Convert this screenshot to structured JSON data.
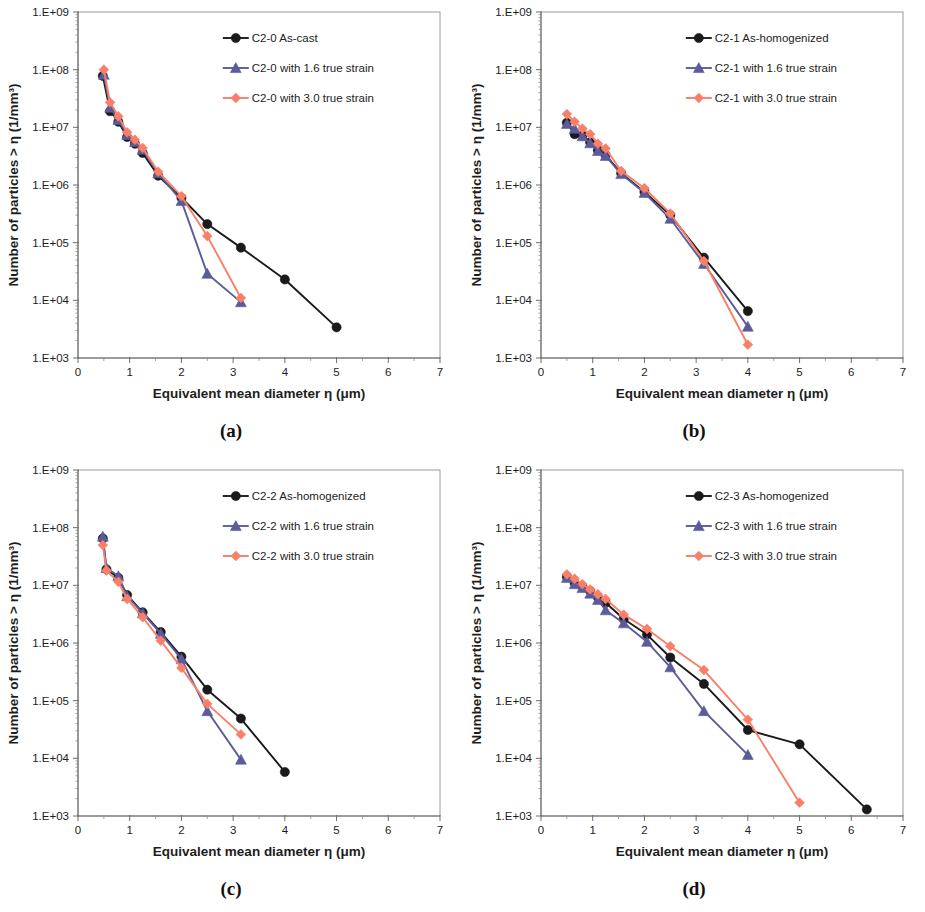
{
  "figure": {
    "panels": [
      {
        "id": "a",
        "caption": "(a)"
      },
      {
        "id": "b",
        "caption": "(b)"
      },
      {
        "id": "c",
        "caption": "(c)"
      },
      {
        "id": "d",
        "caption": "(d)"
      }
    ]
  },
  "style": {
    "colors": {
      "as_processed": "#1a1a1a",
      "strain_16": "#5b5b9c",
      "strain_30": "#fa7f68"
    },
    "markers": {
      "as_processed": "circle",
      "strain_16": "triangle",
      "strain_30": "diamond"
    }
  },
  "chart_data": [
    {
      "type": "line",
      "panel": "a",
      "title": "",
      "xlabel": "Equivalent mean diameter η (μm)",
      "ylabel": "Number of particles > η (1/mm³)",
      "xlim": [
        0,
        7
      ],
      "ylim": [
        1000,
        1000000000
      ],
      "yscale": "log",
      "xticks": [
        0,
        1,
        2,
        3,
        4,
        5,
        6,
        7
      ],
      "xticklabels": [
        "0",
        "1",
        "2",
        "3",
        "4",
        "5",
        "6",
        "7"
      ],
      "yticks": [
        1000,
        10000,
        100000,
        1000000,
        10000000,
        100000000,
        1000000000
      ],
      "yticklabels": [
        "1.E+03",
        "1.E+04",
        "1.E+05",
        "1.E+06",
        "1.E+07",
        "1.E+08",
        "1.E+09"
      ],
      "grid": false,
      "legend_position": "upper right",
      "series": [
        {
          "name": "C2-0 As-cast",
          "marker": "circle",
          "color": "#1a1a1a",
          "x": [
            0.48,
            0.62,
            0.78,
            0.95,
            1.1,
            1.25,
            1.55,
            2.0,
            2.5,
            3.15,
            4.0,
            5.0
          ],
          "y": [
            78000000,
            19000000,
            12500000,
            6800000,
            5200000,
            3600000,
            1450000,
            600000,
            210000,
            82000,
            23000,
            3400
          ]
        },
        {
          "name": "C2-0 with 1.6 true strain",
          "marker": "triangle",
          "color": "#5b5b9c",
          "x": [
            0.5,
            0.62,
            0.78,
            0.95,
            1.1,
            1.25,
            1.55,
            2.0,
            2.5,
            3.15
          ],
          "y": [
            82000000,
            22000000,
            13500000,
            7400000,
            5600000,
            4100000,
            1600000,
            530000,
            29000,
            9300
          ]
        },
        {
          "name": "C2-0 with 3.0 true strain",
          "marker": "diamond",
          "color": "#fa7f68",
          "x": [
            0.5,
            0.62,
            0.78,
            0.95,
            1.1,
            1.25,
            1.55,
            2.0,
            2.5,
            3.15
          ],
          "y": [
            100000000,
            27000000,
            15500000,
            8200000,
            6100000,
            4400000,
            1700000,
            640000,
            130000,
            11000
          ]
        }
      ]
    },
    {
      "type": "line",
      "panel": "b",
      "title": "",
      "xlabel": "Equivalent mean diameter η (μm)",
      "ylabel": "Number of particles > η (1/mm³)",
      "xlim": [
        0,
        7
      ],
      "ylim": [
        1000,
        1000000000
      ],
      "yscale": "log",
      "xticks": [
        0,
        1,
        2,
        3,
        4,
        5,
        6,
        7
      ],
      "xticklabels": [
        "0",
        "1",
        "2",
        "3",
        "4",
        "5",
        "6",
        "7"
      ],
      "yticks": [
        1000,
        10000,
        100000,
        1000000,
        10000000,
        100000000,
        1000000000
      ],
      "yticklabels": [
        "1.E+03",
        "1.E+04",
        "1.E+05",
        "1.E+06",
        "1.E+07",
        "1.E+08",
        "1.E+09"
      ],
      "grid": false,
      "legend_position": "upper right",
      "series": [
        {
          "name": "C2-1 As-homogenized",
          "marker": "circle",
          "color": "#1a1a1a",
          "x": [
            0.5,
            0.65,
            0.8,
            0.95,
            1.1,
            1.25,
            1.55,
            2.0,
            2.5,
            3.15,
            4.0,
            5.0
          ],
          "y": [
            12000000,
            7600000,
            7200000,
            5500000,
            4000000,
            3300000,
            1600000,
            760000,
            300000,
            55000,
            6500
          ],
          "note": "12 x values, 11 y values are the plotted points"
        },
        {
          "name": "C2-1 with 1.6 true strain",
          "marker": "triangle",
          "color": "#5b5b9c",
          "x": [
            0.5,
            0.65,
            0.8,
            0.95,
            1.1,
            1.25,
            1.55,
            2.0,
            2.5,
            3.15,
            4.0,
            5.0
          ],
          "y": [
            11500000,
            9500000,
            7000000,
            5300000,
            3900000,
            3200000,
            1550000,
            730000,
            260000,
            43000,
            3500
          ]
        },
        {
          "name": "C2-1 with 3.0 true strain",
          "marker": "diamond",
          "color": "#fa7f68",
          "x": [
            0.5,
            0.65,
            0.8,
            0.95,
            1.1,
            1.25,
            1.55,
            2.0,
            2.5,
            3.15,
            4.0,
            5.0
          ],
          "y": [
            17000000,
            12500000,
            9500000,
            7600000,
            5200000,
            4300000,
            1750000,
            880000,
            320000,
            48000,
            1700
          ]
        }
      ]
    },
    {
      "type": "line",
      "panel": "c",
      "title": "",
      "xlabel": "Equivalent mean diameter η (μm)",
      "ylabel": "Number of particles > η (1/mm³)",
      "xlim": [
        0,
        7
      ],
      "ylim": [
        1000,
        1000000000
      ],
      "yscale": "log",
      "xticks": [
        0,
        1,
        2,
        3,
        4,
        5,
        6,
        7
      ],
      "xticklabels": [
        "0",
        "1",
        "2",
        "3",
        "4",
        "5",
        "6",
        "7"
      ],
      "yticks": [
        1000,
        10000,
        100000,
        1000000,
        10000000,
        100000000,
        1000000000
      ],
      "yticklabels": [
        "1.E+03",
        "1.E+04",
        "1.E+05",
        "1.E+06",
        "1.E+07",
        "1.E+08",
        "1.E+09"
      ],
      "grid": false,
      "legend_position": "upper right",
      "series": [
        {
          "name": "C2-2 As-homogenized",
          "marker": "circle",
          "color": "#1a1a1a",
          "x": [
            0.48,
            0.55,
            0.78,
            0.95,
            1.25,
            1.6,
            2.0,
            2.5,
            3.15,
            4.0
          ],
          "y": [
            65000000,
            19000000,
            13500000,
            6800000,
            3400000,
            1550000,
            580000,
            155000,
            49000,
            5800
          ]
        },
        {
          "name": "C2-2 with 1.6 true strain",
          "marker": "triangle",
          "color": "#5b5b9c",
          "x": [
            0.48,
            0.55,
            0.78,
            0.95,
            1.25,
            1.6,
            2.0,
            2.5,
            3.15
          ],
          "y": [
            70000000,
            20000000,
            14500000,
            6500000,
            3300000,
            1450000,
            530000,
            66000,
            9500
          ]
        },
        {
          "name": "C2-2 with 3.0 true strain",
          "marker": "diamond",
          "color": "#fa7f68",
          "x": [
            0.48,
            0.55,
            0.78,
            0.95,
            1.25,
            1.6,
            2.0,
            2.5,
            3.15
          ],
          "y": [
            50000000,
            18000000,
            11500000,
            5800000,
            2800000,
            1100000,
            370000,
            88000,
            26000
          ]
        }
      ]
    },
    {
      "type": "line",
      "panel": "d",
      "title": "",
      "xlabel": "Equivalent mean diameter η (μm)",
      "ylabel": "Number of particles > η (1/mm³)",
      "xlim": [
        0,
        7
      ],
      "ylim": [
        1000,
        1000000000
      ],
      "yscale": "log",
      "xticks": [
        0,
        1,
        2,
        3,
        4,
        5,
        6,
        7
      ],
      "xticklabels": [
        "0",
        "1",
        "2",
        "3",
        "4",
        "5",
        "6",
        "7"
      ],
      "yticks": [
        1000,
        10000,
        100000,
        1000000,
        10000000,
        100000000,
        1000000000
      ],
      "yticklabels": [
        "1.E+03",
        "1.E+04",
        "1.E+05",
        "1.E+06",
        "1.E+07",
        "1.E+08",
        "1.E+09"
      ],
      "grid": false,
      "legend_position": "upper right",
      "series": [
        {
          "name": "C2-3 As-homogenized",
          "marker": "circle",
          "color": "#1a1a1a",
          "x": [
            0.5,
            0.65,
            0.8,
            0.95,
            1.1,
            1.25,
            1.6,
            2.05,
            2.5,
            3.15,
            4.0,
            5.0,
            6.3
          ],
          "y": [
            14000000,
            11000000,
            9500000,
            8000000,
            6200000,
            5000000,
            2600000,
            1400000,
            560000,
            195000,
            31000,
            17500,
            1300
          ]
        },
        {
          "name": "C2-3 with 1.6 true strain",
          "marker": "triangle",
          "color": "#5b5b9c",
          "x": [
            0.5,
            0.65,
            0.8,
            0.95,
            1.1,
            1.25,
            1.6,
            2.05,
            2.5,
            3.15,
            4.0
          ],
          "y": [
            13500000,
            10500000,
            9000000,
            7200000,
            5600000,
            3700000,
            2200000,
            1050000,
            380000,
            66000,
            11500
          ]
        },
        {
          "name": "C2-3 with 3.0 true strain",
          "marker": "diamond",
          "color": "#fa7f68",
          "x": [
            0.5,
            0.65,
            0.8,
            0.95,
            1.1,
            1.25,
            1.6,
            2.05,
            2.5,
            3.15,
            4.0,
            5.0
          ],
          "y": [
            15500000,
            13000000,
            10500000,
            8500000,
            7000000,
            5800000,
            3100000,
            1750000,
            880000,
            340000,
            47000,
            1700
          ]
        }
      ]
    }
  ]
}
